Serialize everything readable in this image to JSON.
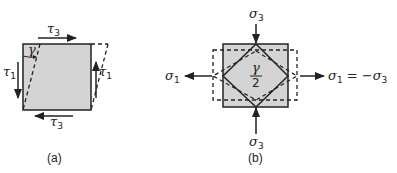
{
  "panel_a": {
    "caption": "(a)",
    "top_label": {
      "sym": "τ",
      "sub": "3"
    },
    "bottom_label": {
      "sym": "τ",
      "sub": "3"
    },
    "left_label": {
      "sym": "τ",
      "sub": "1"
    },
    "right_label": {
      "sym": "τ",
      "sub": "1"
    },
    "angle_label": "γ"
  },
  "panel_b": {
    "caption": "(b)",
    "top_label": {
      "sym": "σ",
      "sub": "3"
    },
    "bottom_label": {
      "sym": "σ",
      "sub": "3"
    },
    "left_label": {
      "sym": "σ",
      "sub": "1"
    },
    "right_label": {
      "sym": "σ",
      "sub": "1",
      "eq": " = −",
      "sym2": "σ",
      "sub2": "3"
    },
    "center_num": "γ",
    "center_den": "2"
  },
  "colors": {
    "fill": "#d4d4d4",
    "line": "#222222"
  }
}
